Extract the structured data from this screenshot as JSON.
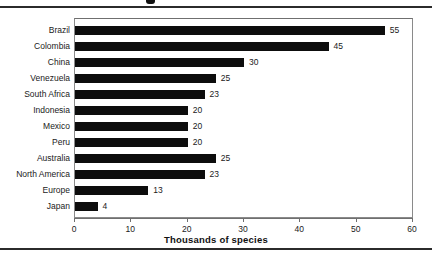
{
  "chart_data": {
    "type": "bar",
    "orientation": "horizontal",
    "title": "",
    "xlabel": "Thousands of species",
    "ylabel": "",
    "xlim": [
      0,
      60
    ],
    "xticks": [
      0,
      10,
      20,
      30,
      40,
      50,
      60
    ],
    "grid": false,
    "legend": null,
    "bar_color": "#0d0d0d",
    "categories": [
      "Brazil",
      "Colombia",
      "China",
      "Venezuela",
      "South Africa",
      "Indonesia",
      "Mexico",
      "Peru",
      "Australia",
      "North America",
      "Europe",
      "Japan"
    ],
    "values": [
      55,
      45,
      30,
      25,
      23,
      20,
      20,
      20,
      25,
      23,
      13,
      4
    ],
    "data_labels": [
      "55",
      "45",
      "30",
      "25",
      "23",
      "20",
      "20",
      "20",
      "25",
      "23",
      "13",
      "4"
    ],
    "tick_labels": [
      "0",
      "10",
      "20",
      "30",
      "40",
      "50",
      "60"
    ]
  }
}
